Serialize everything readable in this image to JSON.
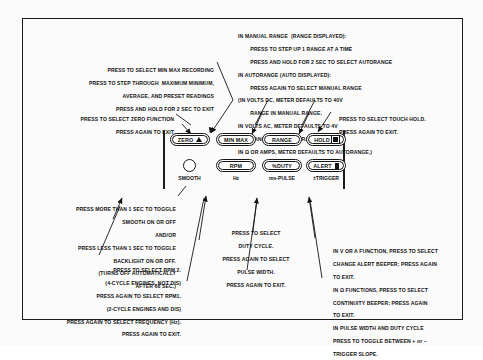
{
  "figure": {
    "title": "",
    "callouts": {
      "min_max": [
        "PRESS TO SELECT MIN MAX RECORDING",
        "PRESS TO STEP THROUGH  MAXIMUM MINIMUM,",
        "AVERAGE, AND PRESET READINGS",
        "PRESS AND HOLD FOR 2 SEC TO EXIT"
      ],
      "range": [
        "IN MANUAL RANGE  (RANGE DISPLAYED):",
        "        PRESS TO STEP UP 1 RANGE AT A TIME",
        "        PRESS AND HOLD FOR 2 SEC TO SELECT AUTORANGE",
        "IN AUTORANGE (AUTO DISPLAYED):",
        "        PRESS AGAIN TO SELECT MANUAL RANGE",
        "(IN VOLTS DC, METER DEFAULTS TO 40V",
        "        RANGE IN MANUAL RANGE.",
        "IN VOLTS AC, METER DEFAULTS TO 4V",
        "        RANGE IN MANUAL RANGE.",
        "IN Ω OR AMPS, METER DEFAULTS TO AUTORANGE.)"
      ],
      "zero": [
        "PRESS TO SELECT ZERO FUNCTION",
        "PRESS AGAIN TO EXIT"
      ],
      "hold": [
        "PRESS TO SELECT TOUCH HOLD.",
        "PRESS AGAIN TO EXIT."
      ],
      "smooth": [
        "PRESS MORE THAN 1 SEC TO TOGGLE",
        "SMOOTH ON OR OFF",
        "AND/OR",
        "PRESS LESS THAN 1 SEC TO TOGGLE",
        "BACKLIGHT ON OR OFF.",
        "(TURNS OFF AUTOMATICALLY",
        "AFTER 68 SEC.)"
      ],
      "rpm": [
        "PRESS TO SELECT RPM 2.",
        "(4-CYCLE ENGINES, NOT DIS)",
        "PRESS AGAIN TO SELECT RPM1.",
        "(2-CYCLE ENGINES AND DIS)",
        "PRESS AGAIN TO SELECT FREQUENCY (Hz).",
        "PRESS AGAIN TO EXIT."
      ],
      "duty": [
        "PRESS TO SELECT",
        "DUTY CYCLE.",
        "PRESS AGAIN TO SELECT",
        "PULSE WIDTH.",
        "PRESS AGAIN TO EXIT."
      ],
      "alert": [
        "IN V OR A FUNCTION, PRESS TO SELECT",
        "CHANGE ALERT BEEPER; PRESS AGAIN",
        "TO EXIT.",
        "IN Ω FUNCTIONS, PRESS TO SELECT",
        "CONTINUITY BEEPER; PRESS AGAIN",
        "TO EXIT.",
        "IN PULSE WIDTH AND DUTY CYCLE",
        "PRESS TO TOGGLE BETWEEN + or –",
        "TRIGGER SLOPE."
      ]
    },
    "keypad": {
      "row1": [
        {
          "label": "ZERO",
          "icon": "warning-triangle-icon"
        },
        {
          "label": "MIN MAX",
          "icon": ""
        },
        {
          "label": "RANGE",
          "icon": ""
        },
        {
          "label": "HOLD",
          "icon": "touch-hold-icon"
        }
      ],
      "row2": [
        {
          "label": "",
          "icon": "smooth-knob-icon",
          "sub": "SMOOTH"
        },
        {
          "label": "RPM",
          "icon": "",
          "sub": "Hz"
        },
        {
          "label": "%DUTY",
          "icon": "",
          "sub": "ms-PULSE"
        },
        {
          "label": "ALERT",
          "icon": "alert-beeper-icon",
          "sub": "±TRIGGER"
        }
      ]
    },
    "colors": {
      "ink": "#111111",
      "paper": "#fbfbfb",
      "frame": "#1a1a1a"
    }
  }
}
